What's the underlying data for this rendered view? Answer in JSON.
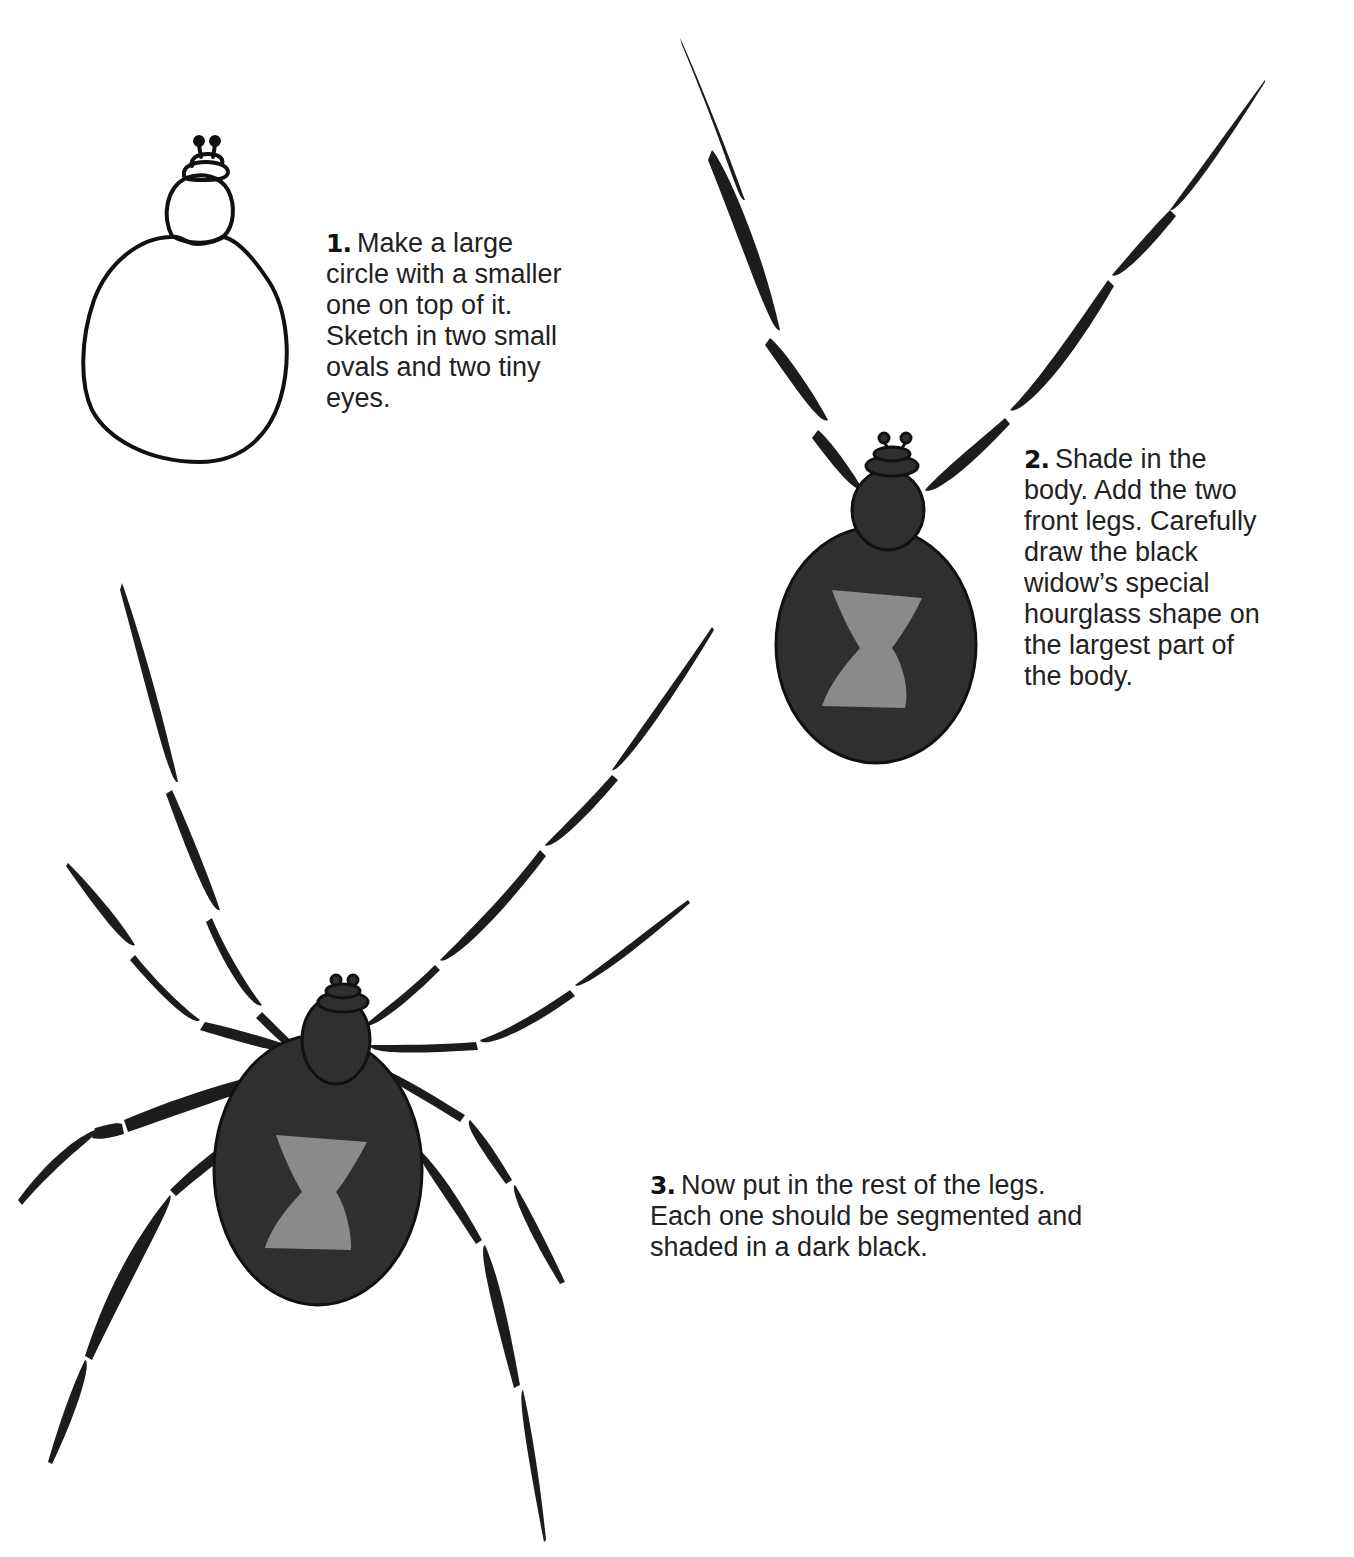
{
  "page": {
    "colors": {
      "background": "#ffffff",
      "outline": "#111111",
      "body_fill": "#2f2f2f",
      "leg_fill": "#1c1c1c",
      "hourglass_fill": "#8a8a8a",
      "text": "#222222"
    }
  },
  "steps": [
    {
      "number": "1.",
      "lines": [
        "Make a large",
        "circle with a smaller",
        "one on top of it.",
        "Sketch in two small",
        "ovals and two tiny",
        "eyes."
      ]
    },
    {
      "number": "2.",
      "lines": [
        "Shade in the",
        "body.  Add the two",
        "front legs.  Carefully",
        "draw the black",
        "widow’s special",
        "hourglass shape on",
        "the largest part of",
        "the body."
      ]
    },
    {
      "number": "3.",
      "lines": [
        "Now put in the rest of the legs.",
        "Each one should be segmented and",
        "shaded in a dark black."
      ]
    }
  ],
  "illustrations": [
    {
      "step": 1,
      "label": "outline sketch: large circle, small circle, two ovals, two eyes"
    },
    {
      "step": 2,
      "label": "shaded body with two front legs and hourglass"
    },
    {
      "step": 3,
      "label": "complete spider with eight segmented legs"
    }
  ]
}
